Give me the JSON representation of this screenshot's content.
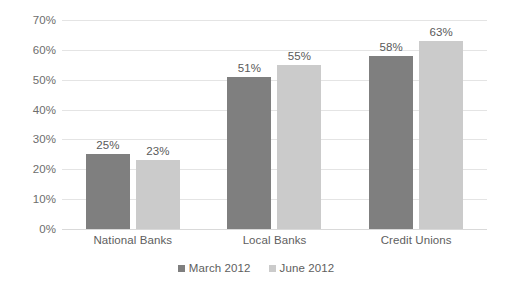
{
  "chart_data": {
    "type": "bar",
    "title": "",
    "subtitle": "",
    "xlabel": "",
    "ylabel": "",
    "categories": [
      "National Banks",
      "Local Banks",
      "Credit Unions"
    ],
    "series": [
      {
        "name": "March 2012",
        "color": "#7f7f7f",
        "values": [
          25,
          23,
          51
        ],
        "data_labels": [
          "25%",
          "51%",
          "58%"
        ]
      },
      {
        "name": "June 2012",
        "color": "#cbcbcb",
        "values": [
          23,
          55,
          63
        ],
        "data_labels": [
          "23%",
          "55%",
          "63%"
        ]
      }
    ],
    "grouped_values": [
      {
        "category": "National Banks",
        "march_2012": 25,
        "june_2012": 23
      },
      {
        "category": "Local Banks",
        "march_2012": 51,
        "june_2012": 55
      },
      {
        "category": "Credit Unions",
        "march_2012": 58,
        "june_2012": 63
      }
    ],
    "ylim": [
      0,
      70
    ],
    "ytick_step": 10,
    "ytick_labels": [
      "0%",
      "10%",
      "20%",
      "30%",
      "40%",
      "50%",
      "60%",
      "70%"
    ],
    "ytick_values": [
      0,
      10,
      20,
      30,
      40,
      50,
      60,
      70
    ],
    "grid": true,
    "grid_axis": "y",
    "legend_position": "bottom-center",
    "legend": [
      "March 2012",
      "June 2012"
    ],
    "data_labels_shown": true,
    "background_color": "#ffffff",
    "gridline_color": "#e4e4e4",
    "text_color": "#5e5e5e"
  }
}
